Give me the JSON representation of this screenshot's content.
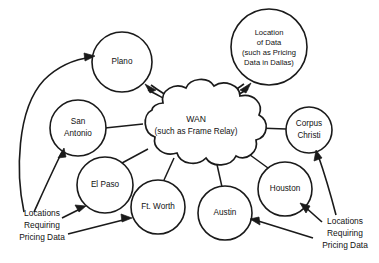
{
  "diagram": {
    "background_color": "#ffffff",
    "line_color": "#1a1a1a",
    "text_color": "#111111",
    "cloud": {
      "name": "wan-cloud",
      "line1": "WAN",
      "line2": "(such as Frame Relay)"
    },
    "data_location_node": {
      "name": "location-of-data",
      "lines": [
        "Location",
        "of Data",
        "(such as Pricing",
        "Data in Dallas)"
      ]
    },
    "sites": [
      {
        "id": "plano",
        "lines": [
          "Plano"
        ]
      },
      {
        "id": "san-antonio",
        "lines": [
          "San",
          "Antonio"
        ]
      },
      {
        "id": "el-paso",
        "lines": [
          "El Paso"
        ]
      },
      {
        "id": "ft-worth",
        "lines": [
          "Ft. Worth"
        ]
      },
      {
        "id": "austin",
        "lines": [
          "Austin"
        ]
      },
      {
        "id": "houston",
        "lines": [
          "Houston"
        ]
      },
      {
        "id": "corpus-christi",
        "lines": [
          "Corpus",
          "Christi"
        ]
      }
    ],
    "callouts": [
      {
        "id": "callout-left",
        "lines": [
          "Locations",
          "Requiring",
          "Pricing Data"
        ],
        "targets": [
          "plano",
          "san-antonio",
          "el-paso",
          "ft-worth"
        ]
      },
      {
        "id": "callout-right",
        "lines": [
          "Locations",
          "Requiring",
          "Pricing Data"
        ],
        "targets": [
          "corpus-christi",
          "houston",
          "austin"
        ]
      }
    ]
  }
}
